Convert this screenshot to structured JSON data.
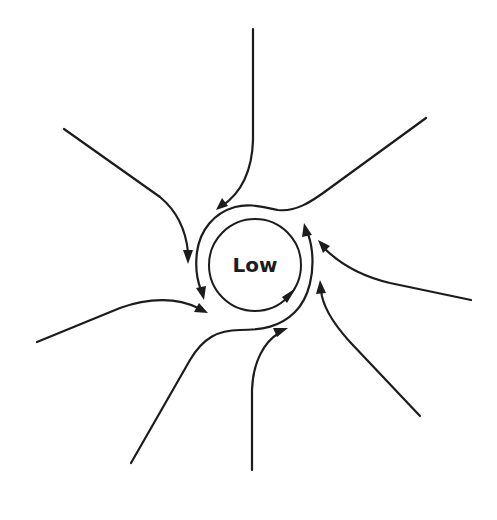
{
  "diagram": {
    "center_label": "Low",
    "type": "cyclonic inflow around low pressure center (Northern Hemisphere, counterclockwise)",
    "colors": {
      "stroke": "#1c1c1c",
      "background": "#ffffff"
    },
    "inflow_arrows": [
      {
        "id": "north",
        "direction": "inward, curving left"
      },
      {
        "id": "north-west",
        "direction": "inward, curving down"
      },
      {
        "id": "west",
        "direction": "inward"
      },
      {
        "id": "south-west",
        "direction": "merges into circulation"
      },
      {
        "id": "south",
        "direction": "inward, curving right"
      },
      {
        "id": "south-east",
        "direction": "inward, curving up"
      },
      {
        "id": "east",
        "direction": "inward, curving up"
      },
      {
        "id": "north-east",
        "direction": "merges into circulation"
      }
    ],
    "circulation": "counterclockwise"
  }
}
